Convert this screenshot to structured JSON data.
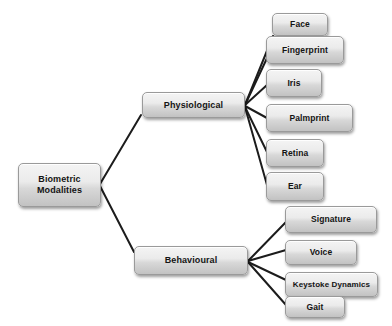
{
  "diagram": {
    "title": "Biometric Modalities",
    "type": "tree",
    "background_color": "#ffffff",
    "node_fill_top": "#f4f4f4",
    "node_fill_bottom": "#c2c2c2",
    "node_border_color": "#9a9a9a",
    "edge_color": "#1c1c1c",
    "root": {
      "label": "Biometric\nModalities"
    },
    "branches": [
      {
        "key": "physiological",
        "label": "Physiological",
        "leaves": [
          {
            "key": "face",
            "label": "Face"
          },
          {
            "key": "fingerprint",
            "label": "Fingerprint"
          },
          {
            "key": "iris",
            "label": "Iris"
          },
          {
            "key": "palmprint",
            "label": "Palmprint"
          },
          {
            "key": "retina",
            "label": "Retina"
          },
          {
            "key": "ear",
            "label": "Ear"
          }
        ]
      },
      {
        "key": "behavioural",
        "label": "Behavioural",
        "leaves": [
          {
            "key": "signature",
            "label": "Signature"
          },
          {
            "key": "voice",
            "label": "Voice"
          },
          {
            "key": "keystoke-dynamics",
            "label": "Keystoke Dynamics"
          },
          {
            "key": "gait",
            "label": "Gait"
          }
        ]
      }
    ]
  }
}
